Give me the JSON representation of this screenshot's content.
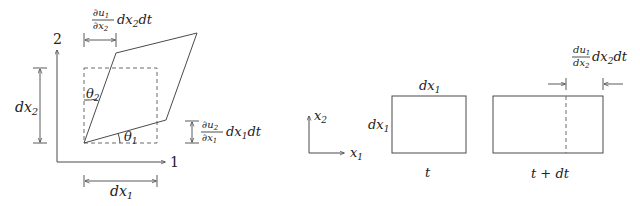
{
  "left_panel": {
    "axis_vertical_label": "2",
    "axis_horizontal_label": "1",
    "dim_vertical": {
      "base": "dx",
      "sub": "2"
    },
    "dim_horizontal": {
      "base": "dx",
      "sub": "1"
    },
    "angle_upper": {
      "base": "θ",
      "sub": "2"
    },
    "angle_lower": {
      "base": "θ",
      "sub": "1"
    },
    "top_shear": {
      "num": "∂u",
      "num_sub": "1",
      "den": "∂x",
      "den_sub": "2",
      "tail1": "dx",
      "tail1_sub": "2",
      "tail2": "dt"
    },
    "right_shear": {
      "num": "∂u",
      "num_sub": "2",
      "den": "∂x",
      "den_sub": "1",
      "tail1": "dx",
      "tail1_sub": "1",
      "tail2": "dt"
    }
  },
  "right_panel": {
    "axis_vertical": {
      "base": "x",
      "sub": "2"
    },
    "axis_horizontal": {
      "base": "x",
      "sub": "1"
    },
    "rect_top": {
      "base": "dx",
      "sub": "1"
    },
    "rect_left": {
      "base": "dx",
      "sub": "1"
    },
    "label_t": "t",
    "label_t_dt": "t + dt",
    "stretch": {
      "num": "du",
      "num_sub": "1",
      "den": "dx",
      "den_sub": "2",
      "tail1": "dx",
      "tail1_sub": "2",
      "tail2": "dt"
    }
  },
  "colors": {
    "line": "#4a4a4a",
    "text": "#222222",
    "background": "#ffffff"
  }
}
